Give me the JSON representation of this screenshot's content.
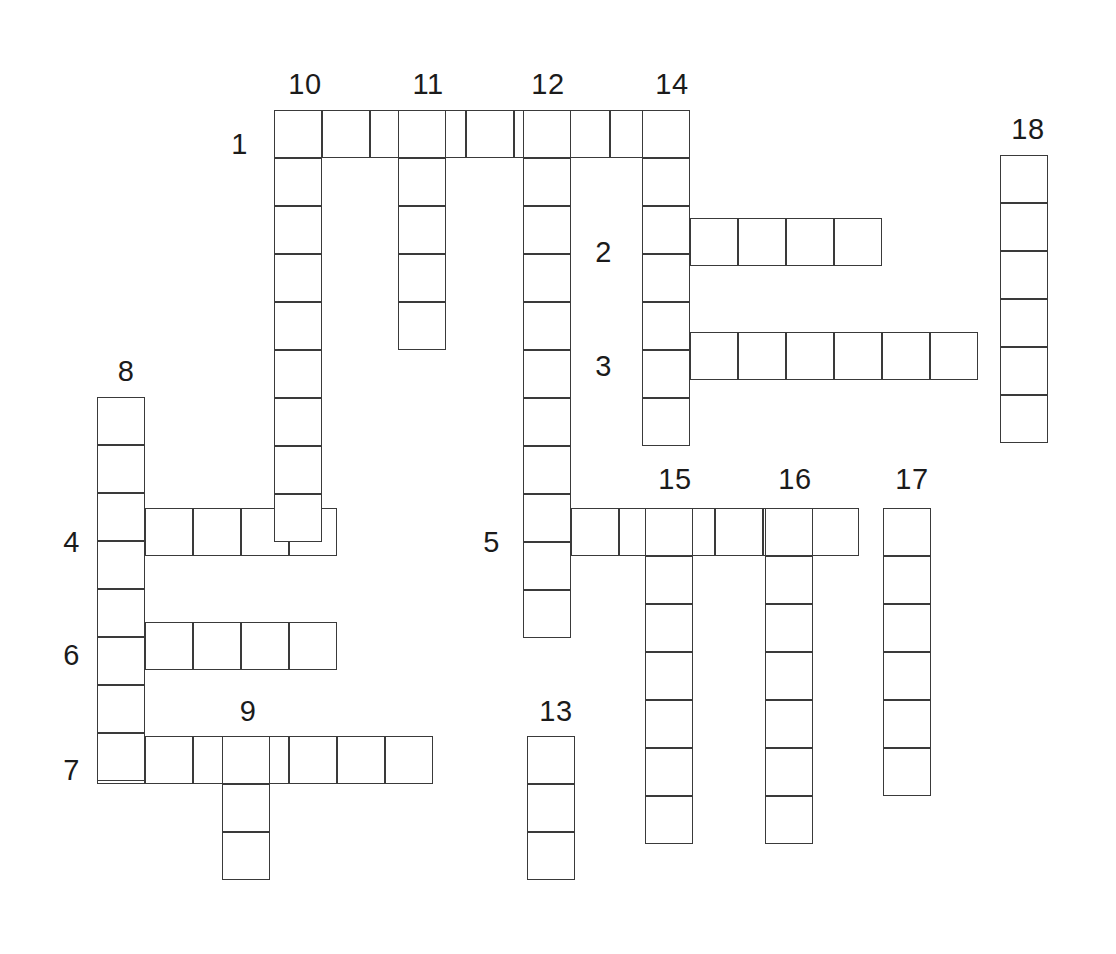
{
  "puzzle": {
    "title": "Crossword Puzzle Grid",
    "type": "crossword-grid",
    "cell_size": 48,
    "grid_origin": {
      "x": 97,
      "y": 110
    },
    "total_clue_numbers": 18,
    "background_color": "#ffffff",
    "line_color": "#3a3a3a",
    "text_color": "#1b1b1b"
  },
  "clue_numbers": [
    {
      "id": "1",
      "label": "1",
      "x": 248,
      "y": 144,
      "anchor": "left",
      "direction": "across",
      "length": 8
    },
    {
      "id": "2",
      "label": "2",
      "x": 612,
      "y": 252,
      "anchor": "left",
      "direction": "across",
      "length": 5
    },
    {
      "id": "3",
      "label": "3",
      "x": 612,
      "y": 366,
      "anchor": "left",
      "direction": "across",
      "length": 7
    },
    {
      "id": "4",
      "label": "4",
      "x": 80,
      "y": 542,
      "anchor": "left",
      "direction": "across",
      "length": 5
    },
    {
      "id": "5",
      "label": "5",
      "x": 500,
      "y": 542,
      "anchor": "left",
      "direction": "across",
      "length": 7
    },
    {
      "id": "6",
      "label": "6",
      "x": 80,
      "y": 655,
      "anchor": "left",
      "direction": "across",
      "length": 5
    },
    {
      "id": "7",
      "label": "7",
      "x": 80,
      "y": 770,
      "anchor": "left",
      "direction": "across",
      "length": 7
    },
    {
      "id": "8",
      "label": "8",
      "x": 126,
      "y": 386,
      "anchor": "top",
      "direction": "down",
      "length": 8
    },
    {
      "id": "9",
      "label": "9",
      "x": 248,
      "y": 726,
      "anchor": "top",
      "direction": "down",
      "length": 3
    },
    {
      "id": "10",
      "label": "10",
      "x": 305,
      "y": 99,
      "anchor": "top",
      "direction": "down",
      "length": 9
    },
    {
      "id": "11",
      "label": "11",
      "x": 428,
      "y": 99,
      "anchor": "top",
      "direction": "down",
      "length": 5
    },
    {
      "id": "12",
      "label": "12",
      "x": 548,
      "y": 99,
      "anchor": "top",
      "direction": "down",
      "length": 11
    },
    {
      "id": "13",
      "label": "13",
      "x": 556,
      "y": 726,
      "anchor": "top",
      "direction": "down",
      "length": 3
    },
    {
      "id": "14",
      "label": "14",
      "x": 672,
      "y": 99,
      "anchor": "top",
      "direction": "down",
      "length": 7
    },
    {
      "id": "15",
      "label": "15",
      "x": 675,
      "y": 494,
      "anchor": "top",
      "direction": "down",
      "length": 7
    },
    {
      "id": "16",
      "label": "16",
      "x": 795,
      "y": 494,
      "anchor": "top",
      "direction": "down",
      "length": 7
    },
    {
      "id": "17",
      "label": "17",
      "x": 912,
      "y": 494,
      "anchor": "top",
      "direction": "down",
      "length": 6
    },
    {
      "id": "18",
      "label": "18",
      "x": 1028,
      "y": 144,
      "anchor": "top",
      "direction": "down",
      "length": 6
    }
  ],
  "entries": [
    {
      "name": "across-1",
      "clue": "1",
      "orientation": "across",
      "x": 274,
      "y": 110,
      "length": 8
    },
    {
      "name": "across-2",
      "clue": "2",
      "orientation": "across",
      "x": 642,
      "y": 218,
      "length": 5
    },
    {
      "name": "across-3",
      "clue": "3",
      "orientation": "across",
      "x": 642,
      "y": 332,
      "length": 7
    },
    {
      "name": "across-4",
      "clue": "4",
      "orientation": "across",
      "x": 97,
      "y": 508,
      "length": 5
    },
    {
      "name": "across-5",
      "clue": "5",
      "orientation": "across",
      "x": 523,
      "y": 508,
      "length": 7
    },
    {
      "name": "across-6",
      "clue": "6",
      "orientation": "across",
      "x": 97,
      "y": 622,
      "length": 5
    },
    {
      "name": "across-7",
      "clue": "7",
      "orientation": "across",
      "x": 97,
      "y": 736,
      "length": 7
    },
    {
      "name": "down-8",
      "clue": "8",
      "orientation": "down",
      "x": 97,
      "y": 397,
      "length": 8
    },
    {
      "name": "down-9",
      "clue": "9",
      "orientation": "down",
      "x": 222,
      "y": 736,
      "length": 3
    },
    {
      "name": "down-10",
      "clue": "10",
      "orientation": "down",
      "x": 274,
      "y": 110,
      "length": 9
    },
    {
      "name": "down-11",
      "clue": "11",
      "orientation": "down",
      "x": 398,
      "y": 110,
      "length": 5
    },
    {
      "name": "down-12",
      "clue": "12",
      "orientation": "down",
      "x": 523,
      "y": 110,
      "length": 11
    },
    {
      "name": "down-13",
      "clue": "13",
      "orientation": "down",
      "x": 527,
      "y": 736,
      "length": 3
    },
    {
      "name": "down-14",
      "clue": "14",
      "orientation": "down",
      "x": 642,
      "y": 110,
      "length": 7
    },
    {
      "name": "down-15",
      "clue": "15",
      "orientation": "down",
      "x": 645,
      "y": 508,
      "length": 7
    },
    {
      "name": "down-16",
      "clue": "16",
      "orientation": "down",
      "x": 765,
      "y": 508,
      "length": 7
    },
    {
      "name": "down-17",
      "clue": "17",
      "orientation": "down",
      "x": 883,
      "y": 508,
      "length": 6
    },
    {
      "name": "down-18",
      "clue": "18",
      "orientation": "down",
      "x": 1000,
      "y": 155,
      "length": 6
    }
  ]
}
